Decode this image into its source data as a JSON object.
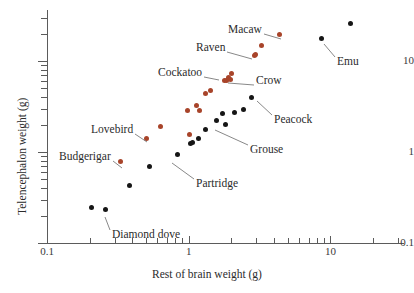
{
  "chart_data": {
    "type": "scatter",
    "title": "",
    "xlabel": "Rest of brain weight (g)",
    "ylabel": "Telencephalon weight (g)",
    "xscale": "log",
    "yscale": "log",
    "xlim": [
      0.1,
      30
    ],
    "ylim": [
      0.1,
      30
    ],
    "grid": false,
    "legend": "none",
    "xticks": [
      0.1,
      1,
      10
    ],
    "xtick_labels": [
      "0.1",
      "1",
      "10"
    ],
    "yticks": [
      0.1,
      1,
      10
    ],
    "ytick_labels": [
      "0.1",
      "1",
      "10"
    ],
    "series": [
      {
        "name": "parrots-and-corvids",
        "color": "#a8442a",
        "points": [
          {
            "x": 0.33,
            "y": 0.78
          },
          {
            "x": 0.5,
            "y": 1.42
          },
          {
            "x": 0.63,
            "y": 1.9
          },
          {
            "x": 1.02,
            "y": 1.55
          },
          {
            "x": 0.98,
            "y": 2.85
          },
          {
            "x": 1.14,
            "y": 3.25
          },
          {
            "x": 1.2,
            "y": 2.85
          },
          {
            "x": 1.32,
            "y": 4.35
          },
          {
            "x": 1.42,
            "y": 4.75
          },
          {
            "x": 1.78,
            "y": 6.1
          },
          {
            "x": 1.86,
            "y": 6.15
          },
          {
            "x": 1.9,
            "y": 6.6
          },
          {
            "x": 1.98,
            "y": 6.2
          },
          {
            "x": 2.0,
            "y": 7.3
          },
          {
            "x": 2.9,
            "y": 11.4
          },
          {
            "x": 2.98,
            "y": 11.8
          },
          {
            "x": 3.25,
            "y": 14.8
          },
          {
            "x": 4.35,
            "y": 19.5
          }
        ]
      },
      {
        "name": "other-birds",
        "color": "#161616",
        "points": [
          {
            "x": 0.205,
            "y": 0.245
          },
          {
            "x": 0.26,
            "y": 0.232
          },
          {
            "x": 0.38,
            "y": 0.425
          },
          {
            "x": 0.53,
            "y": 0.7
          },
          {
            "x": 0.83,
            "y": 0.93
          },
          {
            "x": 1.03,
            "y": 1.25
          },
          {
            "x": 1.06,
            "y": 1.26
          },
          {
            "x": 1.18,
            "y": 1.4
          },
          {
            "x": 1.32,
            "y": 1.78
          },
          {
            "x": 1.56,
            "y": 2.22
          },
          {
            "x": 1.72,
            "y": 2.62
          },
          {
            "x": 1.82,
            "y": 2.0
          },
          {
            "x": 2.1,
            "y": 2.75
          },
          {
            "x": 2.45,
            "y": 2.92
          },
          {
            "x": 2.75,
            "y": 4.0
          },
          {
            "x": 8.7,
            "y": 17.5
          },
          {
            "x": 13.8,
            "y": 26.0
          }
        ]
      }
    ],
    "annotations": [
      {
        "label": "Macaw",
        "tx": 228,
        "ty": 23,
        "px": 281,
        "py": 39
      },
      {
        "label": "Raven",
        "tx": 196,
        "ty": 41,
        "px": 252,
        "py": 59
      },
      {
        "label": "Cockatoo",
        "tx": 158,
        "ty": 66,
        "px": 219,
        "py": 80
      },
      {
        "label": "Crow",
        "tx": 256,
        "ty": 74,
        "px": 228,
        "py": 83
      },
      {
        "label": "Emu",
        "tx": 337,
        "ty": 55,
        "px": 324,
        "py": 44
      },
      {
        "label": "Peacock",
        "tx": 274,
        "ty": 113,
        "px": 257,
        "py": 101
      },
      {
        "label": "Lovebird",
        "tx": 91,
        "ty": 123,
        "px": 147,
        "py": 142
      },
      {
        "label": "Budgerigar",
        "tx": 59,
        "ty": 150,
        "px": 122,
        "py": 168
      },
      {
        "label": "Grouse",
        "tx": 250,
        "ty": 143,
        "px": 215,
        "py": 130
      },
      {
        "label": "Partridge",
        "tx": 196,
        "ty": 177,
        "px": 172,
        "py": 163
      },
      {
        "label": "Diamond dove",
        "tx": 112,
        "ty": 228,
        "px": 105,
        "py": 217
      }
    ]
  },
  "axes": {
    "x_title": "Rest of brain weight (g)",
    "y_title": "Telencephalon weight (g)",
    "x_labels": [
      "0.1",
      "1",
      "10"
    ],
    "y_labels": [
      "0.1",
      "1",
      "10"
    ]
  },
  "colors": {
    "series_orange": "#a8442a",
    "series_black": "#161616",
    "axis": "#5b5b5b",
    "text": "#2b2b2b",
    "background": "#ffffff"
  }
}
